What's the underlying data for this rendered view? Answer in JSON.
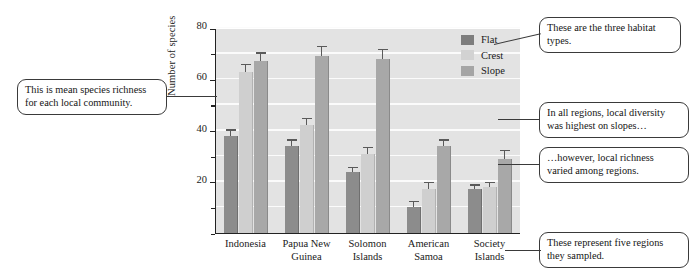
{
  "chart_data": {
    "type": "bar",
    "title": "",
    "xlabel": "",
    "ylabel": "Number of species",
    "ylim": [
      0,
      80
    ],
    "ytick_values": [
      0,
      10,
      20,
      30,
      40,
      50,
      60,
      70,
      80
    ],
    "ytick_labels": [
      "",
      "",
      "20",
      "",
      "40",
      "",
      "60",
      "",
      "80"
    ],
    "grid": "horizontal white gridlines",
    "legend_position": "inside top-right",
    "categories": [
      "Indonesia",
      "Papua New Guinea",
      "Solomon Islands",
      "American Samoa",
      "Society Islands"
    ],
    "series": [
      {
        "name": "Flat",
        "color": "#7d7d7d",
        "values": [
          38,
          34,
          24,
          10,
          17
        ],
        "errors": [
          2.5,
          2.5,
          1.8,
          2.5,
          2.0
        ]
      },
      {
        "name": "Crest",
        "color": "#d2d2d2",
        "values": [
          63,
          42,
          31,
          17,
          18
        ],
        "errors": [
          3.0,
          3.0,
          2.5,
          3.0,
          2.0
        ]
      },
      {
        "name": "Slope",
        "color": "#a5a5a5",
        "values": [
          67,
          69,
          68,
          34,
          29
        ],
        "errors": [
          3.5,
          4.0,
          4.0,
          2.5,
          3.5
        ]
      }
    ]
  },
  "axis": {
    "y_title": "Number of species",
    "y_labels": [
      "80",
      "60",
      "40",
      "20"
    ]
  },
  "legend": {
    "items": [
      {
        "label": "Flat"
      },
      {
        "label": "Crest"
      },
      {
        "label": "Slope"
      }
    ]
  },
  "xaxis": {
    "categories": [
      {
        "line1": "Indonesia",
        "line2": ""
      },
      {
        "line1": "Papua New",
        "line2": "Guinea"
      },
      {
        "line1": "Solomon",
        "line2": "Islands"
      },
      {
        "line1": "American",
        "line2": "Samoa"
      },
      {
        "line1": "Society",
        "line2": "Islands"
      }
    ]
  },
  "callouts": {
    "left_richness": "This is mean species richness for each local community.",
    "habitat_types": "These are the three habitat types.",
    "diversity_slopes": "In all regions, local diversity was highest on slopes…",
    "varied_regions": "…however, local richness varied among regions.",
    "five_regions": "These represent five regions they sampled."
  },
  "colors": {
    "flat": "#7d7d7d",
    "crest": "#d2d2d2",
    "slope": "#a5a5a5",
    "plot_background": "#e3e3e3",
    "gridline": "#fbfbfb",
    "axis": "#222222"
  }
}
